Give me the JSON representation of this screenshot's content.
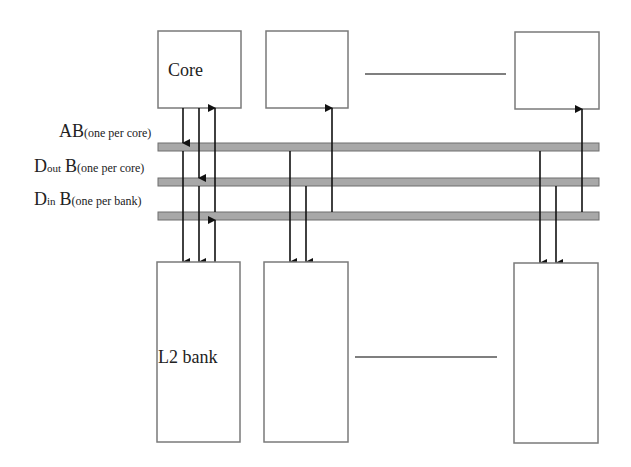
{
  "diagram": {
    "cores": [
      {
        "label": "Core"
      },
      {
        "label": ""
      },
      {
        "label": ""
      }
    ],
    "banks": [
      {
        "label": "L2 bank"
      },
      {
        "label": ""
      },
      {
        "label": ""
      }
    ],
    "buses": [
      {
        "name": "AB",
        "sub": "",
        "note": "(one per core)"
      },
      {
        "name": "D",
        "sub": "out",
        "name2": "B",
        "note": "(one per core)"
      },
      {
        "name": "D",
        "sub": "in",
        "name2": "B",
        "note": "(one per bank)"
      }
    ],
    "colors": {
      "bus_fill": "#a8a8a8",
      "bus_border": "#6f6f6f",
      "box_border": "#7a7a7a",
      "arrow": "#111111"
    }
  }
}
